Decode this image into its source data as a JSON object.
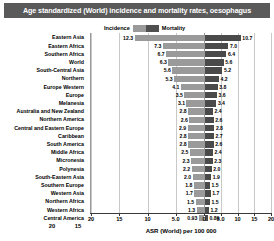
{
  "title": "Age standardized (World) incidence and mortality rates, oesophagus",
  "legend": {
    "incidence_label": "Incidence",
    "mortality_label": "Mortality",
    "incidence_color": "#9a9a9a",
    "mortality_color": "#4a4a4a"
  },
  "axis": {
    "title": "ASR (World) per 100 000",
    "ticks": [
      "20",
      "15",
      "10",
      "5.0",
      "0",
      "5.0",
      "10",
      "15",
      "20"
    ],
    "extra_left_ticks": [
      "20",
      "15"
    ]
  },
  "chart_data": {
    "type": "bar",
    "orientation": "horizontal-diverging",
    "title": "Age standardized (World) incidence and mortality rates, oesophagus",
    "xlabel": "ASR (World) per 100 000",
    "ylabel": "",
    "xlim": [
      20,
      20
    ],
    "grid": true,
    "legend_position": "top-center",
    "categories": [
      "Eastern Asia",
      "Eastern Africa",
      "Southern Africa",
      "World",
      "South-Central Asia",
      "Northern Europe",
      "Western Europe",
      "Melanesia",
      "Australia and New Zealand",
      "Northern America",
      "Central and Eastern Europe",
      "Caribbean",
      "South America",
      "Middle Africa",
      "Micronesia",
      "Polynesia",
      "South-Eastern Asia",
      "Southern Europe",
      "Western Asia",
      "Northern Africa",
      "Western Africa",
      "Central America"
    ],
    "series": [
      {
        "name": "Incidence",
        "color": "#9a9a9a",
        "values": [
          12.3,
          7.3,
          6.7,
          6.3,
          5.6,
          5.3,
          4.1,
          3.5,
          3.1,
          2.8,
          2.6,
          2.9,
          2.8,
          2.8,
          2.5,
          2.3,
          2.2,
          2.0,
          1.8,
          1.7,
          1.5,
          1.3
        ]
      },
      {
        "name": "Mortality",
        "color": "#4a4a4a",
        "values": [
          10.7,
          7.0,
          6.4,
          5.6,
          5.2,
          4.2,
          3.8,
          3.6,
          3.4,
          2.4,
          2.6,
          2.8,
          2.7,
          2.6,
          2.4,
          2.3,
          2.0,
          1.9,
          1.5,
          1.7,
          1.5,
          1.2
        ]
      }
    ],
    "extra_row": {
      "category": "Central America",
      "incidence": 0.93,
      "mortality": 0.89
    },
    "rows": [
      {
        "category": "Eastern Asia",
        "incidence": "12.3",
        "mortality": "10.7"
      },
      {
        "category": "Eastern Africa",
        "incidence": "7.3",
        "mortality": "7.0"
      },
      {
        "category": "Southern Africa",
        "incidence": "6.7",
        "mortality": "6.4"
      },
      {
        "category": "World",
        "incidence": "6.3",
        "mortality": "5.6"
      },
      {
        "category": "South-Central Asia",
        "incidence": "5.6",
        "mortality": "5.2"
      },
      {
        "category": "Northern",
        "incidence": "5.3",
        "mortality": "4.2"
      },
      {
        "category": "Europe Western",
        "incidence": "4.1",
        "mortality": "3.8"
      },
      {
        "category": "Europe",
        "incidence": "3.5",
        "mortality": "3.6"
      },
      {
        "category": "Melanesia",
        "incidence": "3.1",
        "mortality": "3.4"
      },
      {
        "category": "Australia and New Zealand",
        "incidence": "2.8",
        "mortality": "2.4"
      },
      {
        "category": "Northern America",
        "incidence": "2.6",
        "mortality": "2.6"
      },
      {
        "category": "Central and Eastern Europe",
        "incidence": "2.9",
        "mortality": "2.8"
      },
      {
        "category": "Caribbean",
        "incidence": "2.8",
        "mortality": "2.7"
      },
      {
        "category": "South America",
        "incidence": "2.8",
        "mortality": "2.6"
      },
      {
        "category": "Middle Africa",
        "incidence": "2.5",
        "mortality": "2.4"
      },
      {
        "category": "Micronesia",
        "incidence": "2.3",
        "mortality": "2.3"
      },
      {
        "category": "Polynesia",
        "incidence": "2.2",
        "mortality": "2.0"
      },
      {
        "category": "South-Eastern Asia",
        "incidence": "2.0",
        "mortality": "1.9"
      },
      {
        "category": "Southern Europe",
        "incidence": "1.8",
        "mortality": "1.5"
      },
      {
        "category": "Western Asia",
        "incidence": "1.7",
        "mortality": "1.7"
      },
      {
        "category": "Northern Africa",
        "incidence": "1.5",
        "mortality": "1.5"
      },
      {
        "category": "Western Africa",
        "incidence": "1.3",
        "mortality": "1.2"
      },
      {
        "category": "Central America",
        "incidence": "0.93",
        "mortality": "0.89"
      }
    ]
  }
}
